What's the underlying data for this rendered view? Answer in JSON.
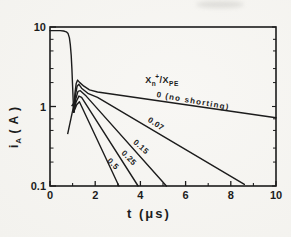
{
  "figure": {
    "background": "#f6f5f1",
    "ink": "#1c1c1c"
  },
  "chart_data": {
    "type": "line",
    "title": "",
    "xlabel": "t (μs)",
    "ylabel": "iA (A)",
    "grid": false,
    "x_axis": {
      "scale": "linear",
      "min": 0,
      "max": 10,
      "major_ticks": [
        0,
        2,
        4,
        6,
        8,
        10
      ],
      "major_tick_labels": [
        "0",
        "2",
        "4",
        "6",
        "8",
        "10"
      ],
      "minor_ticks": [
        1,
        3,
        5,
        7,
        9
      ]
    },
    "y_axis": {
      "scale": "log",
      "min": 0.1,
      "max": 10,
      "major_ticks": [
        10,
        1,
        0.1
      ],
      "major_tick_labels": [
        "10",
        "1",
        "0.1"
      ],
      "minor_ticks": [
        7,
        5,
        3,
        2,
        0.7,
        0.5,
        0.3,
        0.2
      ],
      "label_parts": {
        "symbol": "i",
        "subscript": "A",
        "unit": "( A )"
      }
    },
    "legend_title": {
      "text": "Xn+/XPE",
      "parts": {
        "x1": "X",
        "sub1": "n",
        "sup1": "+",
        "slash": "/",
        "x2": "X",
        "sub2": "PE"
      },
      "anchor_px": {
        "x": 162,
        "y": 80
      }
    },
    "shared_transient": {
      "description": "initial plateau at ~9 A and rapid fall near t = 1 μs common to all curves",
      "points": [
        [
          0,
          9
        ],
        [
          0.45,
          9
        ],
        [
          0.6,
          8.9
        ],
        [
          0.72,
          8.7
        ],
        [
          0.8,
          8.25
        ],
        [
          0.86,
          7.3
        ],
        [
          0.9,
          6.0
        ],
        [
          0.94,
          4.4
        ],
        [
          0.97,
          3.0
        ],
        [
          1.0,
          1.8
        ],
        [
          1.02,
          1.25
        ],
        [
          1.04,
          0.95
        ],
        [
          1.05,
          0.85
        ]
      ]
    },
    "series": [
      {
        "name": "no-shorting",
        "shorting_ratio": 0,
        "label": {
          "text": "0 (no shorting)",
          "x_px": 193,
          "y_px": 101,
          "rotation_deg": 10
        },
        "points": [
          [
            1.05,
            0.85
          ],
          [
            1.1,
            1.45
          ],
          [
            1.16,
            1.95
          ],
          [
            1.22,
            2.15
          ],
          [
            1.32,
            2.0
          ],
          [
            1.5,
            1.8
          ],
          [
            1.75,
            1.62
          ],
          [
            2.1,
            1.52
          ],
          [
            10,
            0.72
          ]
        ]
      },
      {
        "name": "ratio-0.07",
        "shorting_ratio": 0.07,
        "label": {
          "text": "0.07",
          "x_px": 156,
          "y_px": 124,
          "rotation_deg": 33
        },
        "points": [
          [
            1.05,
            0.85
          ],
          [
            1.12,
            1.35
          ],
          [
            1.2,
            1.8
          ],
          [
            1.28,
            1.9
          ],
          [
            1.4,
            1.7
          ],
          [
            1.7,
            1.45
          ],
          [
            2.1,
            1.3
          ],
          [
            8.6,
            0.105
          ]
        ]
      },
      {
        "name": "ratio-0.15",
        "shorting_ratio": 0.15,
        "label": {
          "text": "0.15",
          "x_px": 141,
          "y_px": 147,
          "rotation_deg": 42
        },
        "points": [
          [
            1.05,
            0.85
          ],
          [
            1.14,
            1.25
          ],
          [
            1.24,
            1.55
          ],
          [
            1.34,
            1.58
          ],
          [
            1.6,
            1.35
          ],
          [
            5.15,
            0.1
          ]
        ]
      },
      {
        "name": "ratio-0.25",
        "shorting_ratio": 0.25,
        "label": {
          "text": "0.25",
          "x_px": 129,
          "y_px": 158,
          "rotation_deg": 46
        },
        "points": [
          [
            1.05,
            0.85
          ],
          [
            1.16,
            1.15
          ],
          [
            1.28,
            1.35
          ],
          [
            1.4,
            1.3
          ],
          [
            3.9,
            0.1
          ]
        ]
      },
      {
        "name": "ratio-0.5",
        "shorting_ratio": 0.5,
        "label": {
          "text": "0.5",
          "x_px": 113,
          "y_px": 164,
          "rotation_deg": 46
        },
        "points": [
          [
            1.05,
            0.85
          ],
          [
            1.18,
            1.05
          ],
          [
            1.3,
            1.15
          ],
          [
            3.05,
            0.1
          ]
        ]
      }
    ],
    "annotations": [
      {
        "type": "arrow",
        "name": "transient-arrow",
        "tail": [
          0.78,
          0.45
        ],
        "tip": [
          1.1,
          1.2
        ]
      }
    ]
  }
}
